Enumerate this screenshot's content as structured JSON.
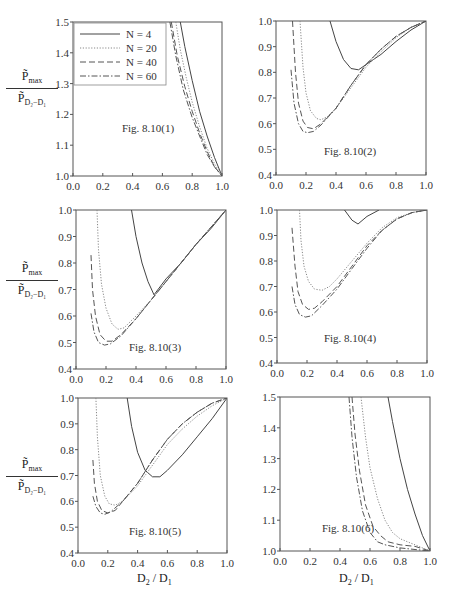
{
  "figure": {
    "y_axis_label": {
      "numerator": "P̃",
      "numerator_sub": "max",
      "denominator": "P̃",
      "denominator_sub": "D₂−D₁"
    },
    "x_axis_label": {
      "main": "D",
      "sub1": "2",
      "sep": " / D",
      "sub2": "1"
    }
  },
  "legend": {
    "entries": [
      {
        "label": "N = 4",
        "style": "solid"
      },
      {
        "label": "N = 20",
        "style": "dotted"
      },
      {
        "label": "N = 40",
        "style": "dashed"
      },
      {
        "label": "N = 60",
        "style": "dashdot"
      }
    ]
  },
  "chart_data": [
    {
      "type": "line",
      "title": "Fig. 8.10(1)",
      "xlabel": "",
      "ylabel": "P̃max / P̃D2−D1",
      "xlim": [
        0,
        1
      ],
      "ylim": [
        1.0,
        1.5
      ],
      "xticks": [
        "0.0",
        "0.2",
        "0.4",
        "0.6",
        "0.8",
        "1.0"
      ],
      "yticks": [
        "1.0",
        "1.1",
        "1.2",
        "1.3",
        "1.4",
        "1.5"
      ],
      "legend_position": "upper left",
      "series": [
        {
          "name": "N = 4",
          "x": [
            0.72,
            0.75,
            0.8,
            0.85,
            0.9,
            0.95,
            1.0
          ],
          "y": [
            1.5,
            1.42,
            1.31,
            1.21,
            1.13,
            1.06,
            1.0
          ]
        },
        {
          "name": "N = 20",
          "x": [
            0.69,
            0.72,
            0.76,
            0.8,
            0.85,
            0.9,
            0.95,
            1.0
          ],
          "y": [
            1.5,
            1.41,
            1.32,
            1.24,
            1.16,
            1.09,
            1.04,
            1.0
          ]
        },
        {
          "name": "N = 40",
          "x": [
            0.66,
            0.7,
            0.75,
            0.8,
            0.85,
            0.9,
            0.95,
            1.0
          ],
          "y": [
            1.5,
            1.39,
            1.29,
            1.21,
            1.14,
            1.08,
            1.03,
            1.0
          ]
        },
        {
          "name": "N = 60",
          "x": [
            0.65,
            0.69,
            0.74,
            0.8,
            0.85,
            0.9,
            0.95,
            1.0
          ],
          "y": [
            1.5,
            1.39,
            1.28,
            1.19,
            1.13,
            1.07,
            1.03,
            1.0
          ]
        }
      ]
    },
    {
      "type": "line",
      "title": "Fig. 8.10(2)",
      "xlim": [
        0,
        1
      ],
      "ylim": [
        0.4,
        1.0
      ],
      "xticks": [
        "0.0",
        "0.2",
        "0.4",
        "0.6",
        "0.8",
        "1.0"
      ],
      "yticks": [
        "0.4",
        "0.5",
        "0.6",
        "0.7",
        "0.8",
        "0.9",
        "1.0"
      ],
      "series": [
        {
          "name": "N = 4",
          "x": [
            0.36,
            0.4,
            0.45,
            0.5,
            0.55,
            0.6,
            0.7,
            0.8,
            0.9,
            1.0
          ],
          "y": [
            1.0,
            0.92,
            0.85,
            0.815,
            0.81,
            0.83,
            0.87,
            0.92,
            0.965,
            1.0
          ]
        },
        {
          "name": "N = 20",
          "x": [
            0.16,
            0.18,
            0.2,
            0.23,
            0.27,
            0.3,
            0.35,
            0.4,
            0.5,
            0.6,
            0.7,
            0.8,
            0.9,
            1.0
          ],
          "y": [
            1.0,
            0.82,
            0.72,
            0.65,
            0.62,
            0.615,
            0.63,
            0.66,
            0.74,
            0.82,
            0.88,
            0.935,
            0.975,
            1.0
          ]
        },
        {
          "name": "N = 40",
          "x": [
            0.11,
            0.13,
            0.15,
            0.18,
            0.21,
            0.25,
            0.3,
            0.4,
            0.5,
            0.6,
            0.7,
            0.8,
            0.9,
            1.0
          ],
          "y": [
            1.0,
            0.8,
            0.68,
            0.61,
            0.585,
            0.58,
            0.6,
            0.66,
            0.75,
            0.83,
            0.89,
            0.94,
            0.975,
            1.0
          ]
        },
        {
          "name": "N = 60",
          "x": [
            0.1,
            0.12,
            0.15,
            0.18,
            0.21,
            0.25,
            0.3,
            0.4,
            0.5,
            0.6,
            0.7,
            0.8,
            0.9,
            1.0
          ],
          "y": [
            0.81,
            0.68,
            0.6,
            0.57,
            0.565,
            0.57,
            0.595,
            0.66,
            0.75,
            0.83,
            0.89,
            0.94,
            0.975,
            1.0
          ]
        }
      ]
    },
    {
      "type": "line",
      "title": "Fig. 8.10(3)",
      "xlim": [
        0,
        1
      ],
      "ylim": [
        0.4,
        1.0
      ],
      "xticks": [
        "0.0",
        "0.2",
        "0.4",
        "0.6",
        "0.8",
        "1.0"
      ],
      "yticks": [
        "0.4",
        "0.5",
        "0.6",
        "0.7",
        "0.8",
        "0.9",
        "1.0"
      ],
      "series": [
        {
          "name": "N = 4",
          "x": [
            0.37,
            0.4,
            0.44,
            0.48,
            0.52,
            0.6,
            0.7,
            0.8,
            0.9,
            1.0
          ],
          "y": [
            1.0,
            0.9,
            0.8,
            0.73,
            0.68,
            0.74,
            0.8,
            0.87,
            0.93,
            1.0
          ]
        },
        {
          "name": "N = 20",
          "x": [
            0.14,
            0.15,
            0.17,
            0.2,
            0.24,
            0.28,
            0.32,
            0.4,
            0.5,
            0.6,
            0.7,
            0.8,
            0.9,
            1.0
          ],
          "y": [
            1.0,
            0.85,
            0.72,
            0.63,
            0.57,
            0.55,
            0.555,
            0.6,
            0.66,
            0.73,
            0.8,
            0.87,
            0.935,
            1.0
          ]
        },
        {
          "name": "N = 40",
          "x": [
            0.1,
            0.11,
            0.13,
            0.16,
            0.2,
            0.24,
            0.3,
            0.4,
            0.5,
            0.6,
            0.7,
            0.8,
            0.9,
            1.0
          ],
          "y": [
            0.83,
            0.7,
            0.6,
            0.53,
            0.505,
            0.505,
            0.53,
            0.59,
            0.66,
            0.73,
            0.8,
            0.87,
            0.935,
            1.0
          ]
        },
        {
          "name": "N = 60",
          "x": [
            0.1,
            0.12,
            0.15,
            0.19,
            0.23,
            0.3,
            0.4,
            0.5,
            0.6,
            0.7,
            0.8,
            0.9,
            1.0
          ],
          "y": [
            0.61,
            0.54,
            0.5,
            0.49,
            0.495,
            0.525,
            0.59,
            0.66,
            0.73,
            0.8,
            0.87,
            0.935,
            1.0
          ]
        }
      ]
    },
    {
      "type": "line",
      "title": "Fig. 8.10(4)",
      "xlim": [
        0,
        1
      ],
      "ylim": [
        0.4,
        1.0
      ],
      "xticks": [
        "0.0",
        "0.2",
        "0.4",
        "0.6",
        "0.8",
        "1.0"
      ],
      "yticks": [
        "0.4",
        "0.5",
        "0.6",
        "0.7",
        "0.8",
        "0.9",
        "1.0"
      ],
      "series": [
        {
          "name": "N = 4",
          "x": [
            0.45,
            0.5,
            0.54,
            0.6,
            0.68
          ],
          "y": [
            1.0,
            0.96,
            0.945,
            0.975,
            1.0
          ]
        },
        {
          "name": "N = 20",
          "x": [
            0.15,
            0.16,
            0.18,
            0.21,
            0.25,
            0.3,
            0.35,
            0.4,
            0.5,
            0.6,
            0.7,
            0.8,
            0.9,
            1.0
          ],
          "y": [
            1.0,
            0.88,
            0.78,
            0.72,
            0.69,
            0.685,
            0.7,
            0.73,
            0.8,
            0.87,
            0.93,
            0.97,
            0.99,
            1.0
          ]
        },
        {
          "name": "N = 40",
          "x": [
            0.1,
            0.12,
            0.14,
            0.17,
            0.21,
            0.25,
            0.3,
            0.4,
            0.5,
            0.6,
            0.7,
            0.8,
            0.9,
            1.0
          ],
          "y": [
            0.93,
            0.78,
            0.68,
            0.63,
            0.61,
            0.615,
            0.64,
            0.7,
            0.78,
            0.86,
            0.92,
            0.965,
            0.99,
            1.0
          ]
        },
        {
          "name": "N = 60",
          "x": [
            0.1,
            0.12,
            0.15,
            0.19,
            0.23,
            0.3,
            0.4,
            0.5,
            0.6,
            0.7,
            0.8,
            0.9,
            1.0
          ],
          "y": [
            0.7,
            0.63,
            0.59,
            0.58,
            0.585,
            0.625,
            0.69,
            0.77,
            0.85,
            0.92,
            0.965,
            0.99,
            1.0
          ]
        }
      ]
    },
    {
      "type": "line",
      "title": "Fig. 8.10(5)",
      "xlabel": "D2 / D1",
      "ylabel": "P̃max / P̃D2−D1",
      "xlim": [
        0,
        1
      ],
      "ylim": [
        0.4,
        1.0
      ],
      "xticks": [
        "0.0",
        "0.2",
        "0.4",
        "0.6",
        "0.8",
        "1.0"
      ],
      "yticks": [
        "0.4",
        "0.5",
        "0.6",
        "0.7",
        "0.8",
        "0.9",
        "1.0"
      ],
      "series": [
        {
          "name": "N = 4",
          "x": [
            0.33,
            0.36,
            0.4,
            0.45,
            0.5,
            0.55,
            0.6,
            0.7,
            0.8,
            0.9,
            1.0
          ],
          "y": [
            1.0,
            0.89,
            0.79,
            0.72,
            0.695,
            0.695,
            0.72,
            0.78,
            0.85,
            0.92,
            1.0
          ]
        },
        {
          "name": "N = 20",
          "x": [
            0.12,
            0.13,
            0.15,
            0.18,
            0.21,
            0.25,
            0.3,
            0.4,
            0.5,
            0.6,
            0.7,
            0.8,
            0.9,
            1.0
          ],
          "y": [
            1.0,
            0.85,
            0.7,
            0.62,
            0.59,
            0.585,
            0.6,
            0.66,
            0.74,
            0.82,
            0.88,
            0.93,
            0.97,
            1.0
          ]
        },
        {
          "name": "N = 40",
          "x": [
            0.1,
            0.11,
            0.13,
            0.16,
            0.2,
            0.25,
            0.3,
            0.4,
            0.5,
            0.6,
            0.7,
            0.8,
            0.9,
            1.0
          ],
          "y": [
            0.76,
            0.67,
            0.6,
            0.565,
            0.555,
            0.565,
            0.6,
            0.67,
            0.76,
            0.84,
            0.9,
            0.945,
            0.98,
            1.0
          ]
        },
        {
          "name": "N = 60",
          "x": [
            0.1,
            0.12,
            0.15,
            0.18,
            0.22,
            0.3,
            0.4,
            0.5,
            0.6,
            0.7,
            0.8,
            0.9,
            1.0
          ],
          "y": [
            0.62,
            0.58,
            0.555,
            0.55,
            0.56,
            0.6,
            0.67,
            0.76,
            0.84,
            0.9,
            0.945,
            0.98,
            1.0
          ]
        }
      ]
    },
    {
      "type": "line",
      "title": "Fig. 8.10(6)",
      "xlabel": "D2 / D1",
      "xlim": [
        0,
        1
      ],
      "ylim": [
        1.0,
        1.5
      ],
      "xticks": [
        "0.0",
        "0.2",
        "0.4",
        "0.6",
        "0.8",
        "1.0"
      ],
      "yticks": [
        "1.0",
        "1.1",
        "1.2",
        "1.3",
        "1.4",
        "1.5"
      ],
      "series": [
        {
          "name": "N = 4",
          "x": [
            0.72,
            0.75,
            0.8,
            0.85,
            0.9,
            0.95,
            1.0
          ],
          "y": [
            1.5,
            1.42,
            1.3,
            1.2,
            1.12,
            1.05,
            1.0
          ]
        },
        {
          "name": "N = 20",
          "x": [
            0.54,
            0.57,
            0.6,
            0.65,
            0.7,
            0.75,
            0.8,
            0.85,
            0.9,
            0.95,
            1.0
          ],
          "y": [
            1.5,
            1.37,
            1.27,
            1.17,
            1.1,
            1.06,
            1.04,
            1.03,
            1.02,
            1.01,
            1.0
          ]
        },
        {
          "name": "N = 40",
          "x": [
            0.48,
            0.5,
            0.53,
            0.57,
            0.62,
            0.67,
            0.72,
            0.8,
            0.9,
            1.0
          ],
          "y": [
            1.5,
            1.38,
            1.26,
            1.15,
            1.08,
            1.05,
            1.03,
            1.02,
            1.015,
            1.0
          ]
        },
        {
          "name": "N = 60",
          "x": [
            0.46,
            0.48,
            0.51,
            0.55,
            0.6,
            0.65,
            0.7,
            0.8,
            0.9,
            1.0
          ],
          "y": [
            1.5,
            1.37,
            1.24,
            1.13,
            1.06,
            1.03,
            1.02,
            1.01,
            1.005,
            1.0
          ]
        }
      ]
    }
  ]
}
